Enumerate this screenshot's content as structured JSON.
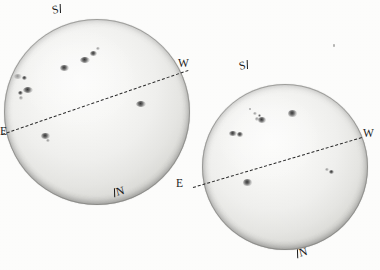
{
  "figure": {
    "media": "grayscale-photograph",
    "background_color": "#fdfdfc",
    "disk_color_center": "#fbfbfa",
    "disk_color_limb": "#a3a39e",
    "spot_color": "#282828",
    "equator_color": "#2b2b2b",
    "label_color": "#1b1b1b"
  },
  "disks": [
    {
      "id": "left-disk",
      "name": "solar-disk-left",
      "cx": 97,
      "cy": 112,
      "r": 93,
      "equator": {
        "angle_deg": -13.5,
        "style": "dashed",
        "x1": 2,
        "y1": 134,
        "x2": 188,
        "y2": 70
      },
      "labels": {
        "south": "S",
        "west": "W",
        "east": "E",
        "north": "N"
      },
      "label_positions": {
        "south": {
          "x": 52,
          "y": 4
        },
        "west": {
          "x": 178,
          "y": 58
        },
        "east": {
          "x": 0,
          "y": 126
        },
        "north": {
          "x": 114,
          "y": 186
        }
      },
      "sunspot_groups": [
        {
          "label": "group-a",
          "x": 14,
          "y": 74,
          "w": 8,
          "h": 5,
          "intensity": "faint"
        },
        {
          "label": "group-b",
          "x": 22,
          "y": 76,
          "w": 5,
          "h": 4,
          "intensity": "dark"
        },
        {
          "label": "group-c",
          "x": 23,
          "y": 87,
          "w": 10,
          "h": 6,
          "intensity": "dark"
        },
        {
          "label": "group-d",
          "x": 18,
          "y": 91,
          "w": 5,
          "h": 4,
          "intensity": "dark"
        },
        {
          "label": "group-e",
          "x": 19,
          "y": 96,
          "w": 4,
          "h": 4,
          "intensity": "faint"
        },
        {
          "label": "group-f",
          "x": 60,
          "y": 65,
          "w": 9,
          "h": 6,
          "intensity": "dark"
        },
        {
          "label": "group-g",
          "x": 80,
          "y": 57,
          "w": 10,
          "h": 6,
          "intensity": "dark"
        },
        {
          "label": "group-h",
          "x": 90,
          "y": 51,
          "w": 7,
          "h": 5,
          "intensity": "dark"
        },
        {
          "label": "group-i",
          "x": 96,
          "y": 47,
          "w": 4,
          "h": 3,
          "intensity": "faint"
        },
        {
          "label": "group-j",
          "x": 136,
          "y": 101,
          "w": 10,
          "h": 6,
          "intensity": "dark"
        },
        {
          "label": "group-k",
          "x": 41,
          "y": 133,
          "w": 9,
          "h": 6,
          "intensity": "dark"
        },
        {
          "label": "group-l",
          "x": 46,
          "y": 139,
          "w": 4,
          "h": 3,
          "intensity": "faint"
        }
      ]
    },
    {
      "id": "right-disk",
      "name": "solar-disk-right",
      "cx": 285,
      "cy": 167,
      "r": 83,
      "equator": {
        "angle_deg": -11.5,
        "style": "dashed",
        "x1": 193,
        "y1": 187,
        "x2": 362,
        "y2": 137
      },
      "labels": {
        "south": "S",
        "west": "W",
        "east": "E",
        "north": "N"
      },
      "label_positions": {
        "south": {
          "x": 239,
          "y": 60
        },
        "west": {
          "x": 363,
          "y": 128
        },
        "east": {
          "x": 176,
          "y": 178
        },
        "north": {
          "x": 297,
          "y": 247
        }
      },
      "sunspot_groups": [
        {
          "label": "group-a",
          "x": 253,
          "y": 112,
          "w": 4,
          "h": 3,
          "intensity": "faint"
        },
        {
          "label": "group-b",
          "x": 258,
          "y": 114,
          "w": 3,
          "h": 3,
          "intensity": "tiny"
        },
        {
          "label": "group-c",
          "x": 255,
          "y": 117,
          "w": 4,
          "h": 4,
          "intensity": "faint"
        },
        {
          "label": "group-d",
          "x": 258,
          "y": 117,
          "w": 8,
          "h": 6,
          "intensity": "dark"
        },
        {
          "label": "group-e",
          "x": 288,
          "y": 110,
          "w": 9,
          "h": 7,
          "intensity": "dark"
        },
        {
          "label": "group-f",
          "x": 229,
          "y": 131,
          "w": 8,
          "h": 5,
          "intensity": "dark"
        },
        {
          "label": "group-g",
          "x": 237,
          "y": 132,
          "w": 6,
          "h": 5,
          "intensity": "dark"
        },
        {
          "label": "group-h",
          "x": 243,
          "y": 179,
          "w": 9,
          "h": 7,
          "intensity": "dark"
        },
        {
          "label": "group-i",
          "x": 325,
          "y": 168,
          "w": 4,
          "h": 3,
          "intensity": "faint"
        },
        {
          "label": "group-j",
          "x": 329,
          "y": 170,
          "w": 5,
          "h": 4,
          "intensity": "dark"
        }
      ]
    }
  ],
  "specks": [
    {
      "name": "dust-speck-top-right",
      "x": 333,
      "y": 44,
      "w": 2,
      "h": 3
    },
    {
      "name": "dust-speck-mid",
      "x": 249,
      "y": 108,
      "w": 2,
      "h": 2
    }
  ],
  "bottom_caption": {
    "visible_fragment": "",
    "note": "faint cut-off text row at the very bottom edge"
  }
}
